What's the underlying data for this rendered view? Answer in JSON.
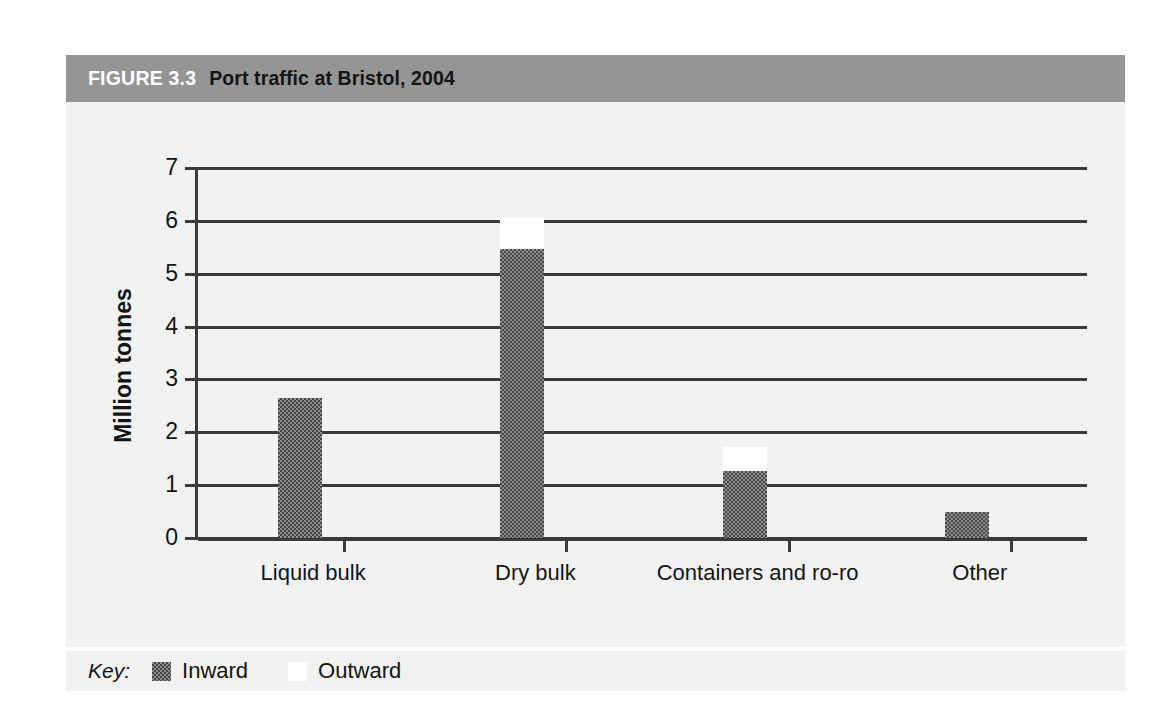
{
  "figure": {
    "number_label": "FIGURE 3.3",
    "caption": "Port traffic at Bristol, 2004",
    "band_color": "#959595",
    "background_color": "#f2f2f2"
  },
  "key": {
    "label": "Key:",
    "entries": [
      {
        "name": "inward-swatch",
        "label": "Inward",
        "color": "#8d8d8d"
      },
      {
        "name": "outward-swatch",
        "label": "Outward",
        "color": "#ffffff"
      }
    ]
  },
  "chart_data": {
    "type": "bar",
    "title": "Port traffic at Bristol, 2004",
    "subtitle": "FIGURE 3.3",
    "stacked": true,
    "xlabel": "",
    "ylabel": "Million tonnes",
    "ylim": [
      0,
      7
    ],
    "yticks": [
      0,
      1,
      2,
      3,
      4,
      5,
      6,
      7
    ],
    "ytick_labels": [
      "0",
      "1",
      "2",
      "3",
      "4",
      "5",
      "6",
      "7"
    ],
    "grid": "horizontal",
    "legend": "bottom",
    "categories": [
      "Liquid bulk",
      "Dry bulk",
      "Containers and ro-ro",
      "Other"
    ],
    "series": [
      {
        "name": "Inward",
        "color": "#8d8d8d",
        "values": [
          2.65,
          5.47,
          1.27,
          0.5
        ]
      },
      {
        "name": "Outward",
        "color": "#ffffff",
        "values": [
          0.0,
          0.58,
          0.45,
          0.0
        ]
      }
    ],
    "totals": [
      2.65,
      6.05,
      1.72,
      0.5
    ]
  }
}
